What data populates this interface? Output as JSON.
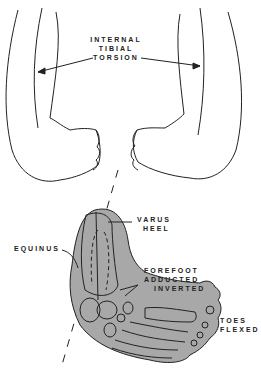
{
  "labels": {
    "torsion": [
      "INTERNAL",
      "TIBIAL",
      "TORSION"
    ],
    "varus_heel": [
      "VARUS",
      "HEEL"
    ],
    "equinus": "EQUINUS",
    "forefoot": [
      "FOREFOOT",
      "ADDUCTED",
      "INVERTED"
    ],
    "toes_flexed": [
      "TOES",
      "FLEXED"
    ]
  },
  "colors": {
    "foot_fill": "#a8a8a8",
    "line": "#222222",
    "background": "#ffffff"
  }
}
